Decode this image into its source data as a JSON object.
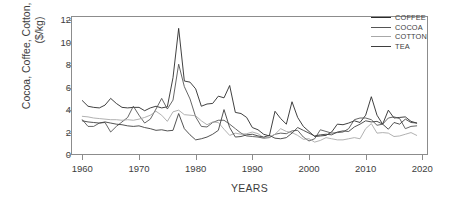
{
  "chart_data": {
    "type": "line",
    "title": "",
    "xlabel": "YEARS",
    "ylabel": "Cocoa, Coffee, Cotton, Tea Prices ($/kg)",
    "xlim": [
      1958,
      2021
    ],
    "ylim": [
      0,
      12.4
    ],
    "grid": false,
    "legend_position": "top-right",
    "xticks": [
      1960,
      1970,
      1980,
      1990,
      2000,
      2010,
      2020
    ],
    "yticks": [
      0,
      2,
      4,
      6,
      8,
      10,
      12
    ],
    "x": [
      1960,
      1961,
      1962,
      1963,
      1964,
      1965,
      1966,
      1967,
      1968,
      1969,
      1970,
      1971,
      1972,
      1973,
      1974,
      1975,
      1976,
      1977,
      1978,
      1979,
      1980,
      1981,
      1982,
      1983,
      1984,
      1985,
      1986,
      1987,
      1988,
      1989,
      1990,
      1991,
      1992,
      1993,
      1994,
      1995,
      1996,
      1997,
      1998,
      1999,
      2000,
      2001,
      2002,
      2003,
      2004,
      2005,
      2006,
      2007,
      2008,
      2009,
      2010,
      2011,
      2012,
      2013,
      2014,
      2015,
      2016,
      2017,
      2018,
      2019
    ],
    "series": [
      {
        "name": "COFFEE",
        "color": "#2b2b2b",
        "values": [
          4.85,
          4.35,
          4.25,
          4.2,
          4.45,
          5.05,
          4.6,
          4.25,
          4.2,
          4.25,
          4.25,
          3.95,
          4.2,
          4.35,
          4.2,
          4.3,
          6.9,
          11.3,
          6.6,
          6.5,
          5.9,
          4.35,
          4.55,
          4.6,
          5.25,
          5.1,
          6.2,
          3.8,
          3.7,
          3.35,
          2.45,
          2.25,
          1.85,
          1.7,
          3.9,
          3.25,
          2.75,
          4.75,
          3.35,
          2.55,
          2.1,
          1.65,
          1.7,
          1.75,
          2.05,
          2.75,
          2.7,
          2.85,
          3.05,
          2.9,
          3.55,
          5.2,
          3.55,
          2.75,
          4.0,
          3.3,
          3.35,
          3.4,
          3.0,
          2.85
        ]
      },
      {
        "name": "COCOA",
        "color": "#555555",
        "values": [
          3.15,
          2.55,
          2.55,
          2.85,
          2.9,
          2.05,
          2.55,
          2.95,
          3.35,
          4.35,
          3.55,
          2.85,
          3.2,
          4.1,
          5.05,
          4.1,
          4.9,
          8.1,
          6.1,
          5.0,
          3.4,
          2.55,
          2.5,
          2.9,
          3.1,
          3.1,
          2.75,
          2.35,
          1.95,
          1.7,
          1.65,
          1.6,
          1.5,
          1.55,
          1.85,
          1.95,
          1.9,
          2.15,
          2.2,
          1.6,
          1.25,
          1.45,
          2.25,
          2.1,
          1.95,
          2.0,
          2.05,
          2.35,
          3.15,
          3.3,
          3.3,
          3.15,
          2.65,
          2.75,
          3.3,
          3.4,
          3.25,
          2.35,
          2.55,
          2.6
        ]
      },
      {
        "name": "COTTON",
        "color": "#a8a8a8",
        "values": [
          3.45,
          3.4,
          3.3,
          3.25,
          3.2,
          3.15,
          3.15,
          3.1,
          3.15,
          3.1,
          3.2,
          3.35,
          3.55,
          3.9,
          3.55,
          3.0,
          3.85,
          4.0,
          3.6,
          3.55,
          3.5,
          3.05,
          2.7,
          2.95,
          2.9,
          2.3,
          1.75,
          1.95,
          1.85,
          1.9,
          2.05,
          1.9,
          1.55,
          1.6,
          1.85,
          2.35,
          2.1,
          2.0,
          1.75,
          1.4,
          1.45,
          1.15,
          1.3,
          1.55,
          1.45,
          1.35,
          1.35,
          1.45,
          1.55,
          1.45,
          2.35,
          2.8,
          1.95,
          2.0,
          1.95,
          1.65,
          1.7,
          1.85,
          2.0,
          1.75
        ]
      },
      {
        "name": "TEA",
        "color": "#3f3f3f",
        "values": [
          3.05,
          2.95,
          2.9,
          2.85,
          2.95,
          2.85,
          2.75,
          2.7,
          2.6,
          2.55,
          2.6,
          2.45,
          2.35,
          2.2,
          2.25,
          2.15,
          2.2,
          3.7,
          2.35,
          1.8,
          1.35,
          1.45,
          1.6,
          1.85,
          2.2,
          4.05,
          2.45,
          1.6,
          1.65,
          1.8,
          1.85,
          1.7,
          1.6,
          1.75,
          1.5,
          1.45,
          1.55,
          1.95,
          2.45,
          2.2,
          1.95,
          1.7,
          1.8,
          1.85,
          1.8,
          2.05,
          2.15,
          2.1,
          2.5,
          2.75,
          3.05,
          2.95,
          3.0,
          2.75,
          2.3,
          2.9,
          2.75,
          3.2,
          2.9,
          2.85
        ]
      }
    ]
  },
  "legend": {
    "items": [
      {
        "label": "COFFEE"
      },
      {
        "label": "COCOA"
      },
      {
        "label": "COTTON"
      },
      {
        "label": "TEA"
      }
    ]
  }
}
